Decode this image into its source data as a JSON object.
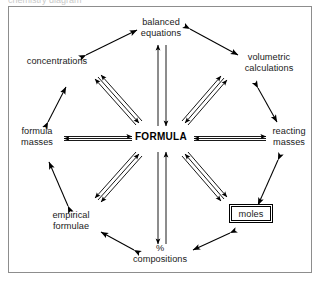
{
  "diagram": {
    "frame_color": "#8d8d8d",
    "ink_color": "#000000",
    "background": "#ffffff",
    "clipped_header_text": "chemistry diagram",
    "center": {
      "id": "formula",
      "label": "FORMULA",
      "style": "bold-caps"
    },
    "nodes": [
      {
        "id": "balanced-equations",
        "line1": "balanced",
        "line2": "equations",
        "position": "top",
        "boxed": false
      },
      {
        "id": "volumetric-calculations",
        "line1": "volumetric",
        "line2": "calculations",
        "position": "top-right",
        "boxed": false
      },
      {
        "id": "reacting-masses",
        "line1": "reacting",
        "line2": "masses",
        "position": "right",
        "boxed": false
      },
      {
        "id": "moles",
        "line1": "moles",
        "line2": "",
        "position": "bottom-right",
        "boxed": true
      },
      {
        "id": "percent-compositions",
        "line1": "%",
        "line2": "compositions",
        "position": "bottom",
        "boxed": false
      },
      {
        "id": "empirical-formulae",
        "line1": "empirical",
        "line2": "formulae",
        "position": "bottom-left",
        "boxed": false
      },
      {
        "id": "formula-masses",
        "line1": "formula",
        "line2": "masses",
        "position": "left",
        "boxed": false
      },
      {
        "id": "concentrations",
        "line1": "concentrations",
        "line2": "",
        "position": "top-left",
        "boxed": false
      }
    ],
    "spokes": [
      {
        "from": "formula",
        "to": "balanced-equations",
        "style": "double-line",
        "heads": "both"
      },
      {
        "from": "formula",
        "to": "volumetric-calculations",
        "style": "double-line",
        "heads": "both"
      },
      {
        "from": "formula",
        "to": "reacting-masses",
        "style": "double-line",
        "heads": "both"
      },
      {
        "from": "formula",
        "to": "moles",
        "style": "double-line",
        "heads": "both"
      },
      {
        "from": "formula",
        "to": "percent-compositions",
        "style": "double-line",
        "heads": "both"
      },
      {
        "from": "formula",
        "to": "empirical-formulae",
        "style": "double-line",
        "heads": "both"
      },
      {
        "from": "formula",
        "to": "formula-masses",
        "style": "double-line",
        "heads": "both"
      },
      {
        "from": "formula",
        "to": "concentrations",
        "style": "double-line",
        "heads": "both"
      }
    ],
    "ring_links": [
      {
        "from": "concentrations",
        "to": "balanced-equations",
        "style": "single-line",
        "heads": "both"
      },
      {
        "from": "balanced-equations",
        "to": "volumetric-calculations",
        "style": "single-line",
        "heads": "both"
      },
      {
        "from": "volumetric-calculations",
        "to": "reacting-masses",
        "style": "single-line",
        "heads": "both"
      },
      {
        "from": "reacting-masses",
        "to": "moles",
        "style": "single-line",
        "heads": "both"
      },
      {
        "from": "moles",
        "to": "percent-compositions",
        "style": "single-line",
        "heads": "both"
      },
      {
        "from": "percent-compositions",
        "to": "empirical-formulae",
        "style": "single-line",
        "heads": "both"
      },
      {
        "from": "empirical-formulae",
        "to": "formula-masses",
        "style": "single-line",
        "heads": "both"
      },
      {
        "from": "formula-masses",
        "to": "concentrations",
        "style": "single-line",
        "heads": "both"
      }
    ]
  }
}
